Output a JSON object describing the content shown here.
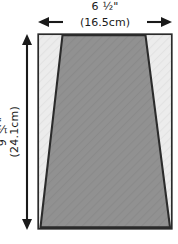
{
  "figure": {
    "width_dimension": {
      "imperial": "6 ½\"",
      "metric": "(16.5cm)",
      "arrow_left_icon": "arrow-left-icon",
      "arrow_right_icon": "arrow-right-icon"
    },
    "height_dimension": {
      "imperial": "9 ½\"",
      "metric": "(24.1cm)",
      "arrow_up_icon": "arrow-up-icon",
      "arrow_down_icon": "arrow-down-icon"
    },
    "shapes": {
      "outer_rectangle": {
        "name": "outer-rectangle",
        "fill": "#e9e9e9",
        "stroke": "#2b2b2b",
        "stroke_width": 1.6
      },
      "inner_trapezoid": {
        "name": "inner-trapezoid",
        "fill": "#8f8f8f",
        "stroke": "#2b2b2b",
        "stroke_width": 2
      }
    },
    "colors": {
      "background": "#ffffff",
      "ink": "#1a1a1a",
      "outline": "#2b2b2b",
      "light_gray": "#e9e9e9",
      "mid_gray": "#8f8f8f"
    }
  }
}
